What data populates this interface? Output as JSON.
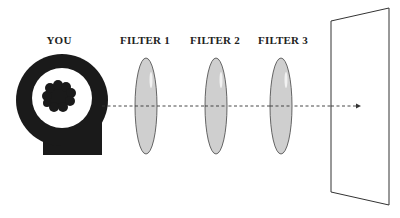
{
  "labels": {
    "you": "YOU",
    "filter1": "FILTER 1",
    "filter2": "FILTER 2",
    "filter3": "FILTER 3"
  },
  "colors": {
    "head": "#1a1a1a",
    "filter_fill": "#cfcfcf",
    "filter_stroke": "#555555",
    "arrow": "#333333",
    "screen_stroke": "#333333",
    "background": "#ffffff"
  },
  "elements": {
    "observer": "head-icon",
    "filters": [
      "filter-1",
      "filter-2",
      "filter-3"
    ],
    "projection": "screen-panel",
    "ray": "dashed-arrow"
  }
}
